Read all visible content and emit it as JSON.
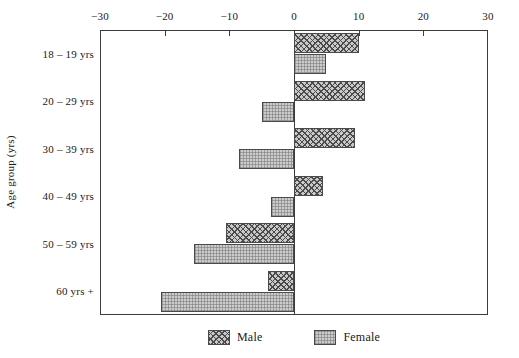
{
  "chart_data": {
    "type": "bar",
    "orientation": "horizontal",
    "style": "diverging-population-pyramid",
    "title": "",
    "xlabel": "",
    "ylabel": "Age group (yrs)",
    "categories": [
      "18 – 19 yrs",
      "20 – 29 yrs",
      "30 – 39 yrs",
      "40 – 49 yrs",
      "50 – 59 yrs",
      "60 yrs +"
    ],
    "series": [
      {
        "name": "Male",
        "values": [
          10,
          11,
          9.5,
          4.5,
          -10.5,
          -4
        ]
      },
      {
        "name": "Female",
        "values": [
          5,
          -5,
          -8.5,
          -3.5,
          -15.5,
          -20.5
        ]
      }
    ],
    "xlim": [
      -30,
      30
    ],
    "xticks": [
      -30,
      -20,
      -10,
      0,
      10,
      20,
      30
    ],
    "xtick_labels": [
      "−30",
      "−20",
      "−10",
      "0",
      "10",
      "20",
      "30"
    ],
    "grid": false,
    "axis_position": "top",
    "legend_position": "bottom-center",
    "legend_entries": [
      "Male",
      "Female"
    ],
    "colors": {
      "male": "#c9c9c9",
      "female": "#cccccc",
      "outline": "#4a4a4a",
      "axis": "#3c3c3c"
    }
  }
}
